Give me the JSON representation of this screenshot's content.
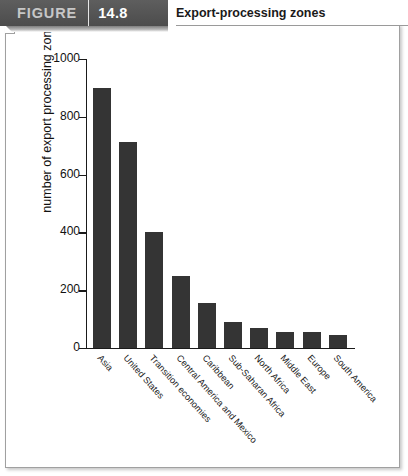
{
  "header": {
    "figure_word": "FIGURE",
    "figure_number": "14.8",
    "title": "Export-processing zones"
  },
  "chart_data": {
    "type": "bar",
    "title": "Export-processing zones",
    "xlabel": "",
    "ylabel": "number of export processing zones",
    "ylim": [
      0,
      1000
    ],
    "yticks": [
      0,
      200,
      400,
      600,
      800,
      1000
    ],
    "ytick_labels": [
      "0",
      "200",
      "400",
      "600",
      "800",
      "1000"
    ],
    "grid": false,
    "legend": "none",
    "bar_color": "#343434",
    "categories": [
      "Asia",
      "United States",
      "Transition economies",
      "Central America and Mexico",
      "Caribbean",
      "Sub-Saharan Africa",
      "North Africa",
      "Middle East",
      "Europe",
      "South America"
    ],
    "values": [
      900,
      712,
      400,
      250,
      155,
      90,
      70,
      55,
      55,
      45
    ]
  }
}
